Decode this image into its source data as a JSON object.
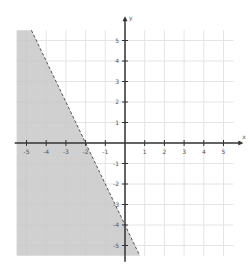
{
  "chart_data": {
    "type": "area",
    "title": "",
    "xlabel": "x",
    "ylabel": "y",
    "xlim": [
      -5.5,
      5.5
    ],
    "ylim": [
      -5.5,
      5.5
    ],
    "grid": true,
    "x_ticks": [
      -5,
      -4,
      -3,
      -2,
      -1,
      1,
      2,
      3,
      4,
      5
    ],
    "y_ticks": [
      5,
      4,
      3,
      2,
      1,
      -1,
      -2,
      -3,
      -4,
      -5
    ],
    "x_tick_labels": [
      "-5",
      "-4",
      "-3",
      "-2",
      "-1",
      "1",
      "2",
      "3",
      "4",
      "5"
    ],
    "y_tick_labels": [
      "5",
      "4",
      "3",
      "2",
      "1",
      "-1",
      "-2",
      "-3",
      "-4",
      "-5"
    ],
    "boundary_line": {
      "equation": "y = -2x - 4",
      "slope": -2,
      "intercept": -4,
      "style": "dashed",
      "points": [
        [
          -4.75,
          5.5
        ],
        [
          -2,
          0
        ],
        [
          0,
          -4
        ],
        [
          0.75,
          -5.5
        ]
      ]
    },
    "shaded_region": {
      "inequality": "y < -2x - 4",
      "side": "left/below",
      "color": "#c8c8c8"
    },
    "colors": {
      "axis": "#333333",
      "grid": "#e4e4e4",
      "shade": "#c8c8c8",
      "boundary": "#555555"
    }
  }
}
